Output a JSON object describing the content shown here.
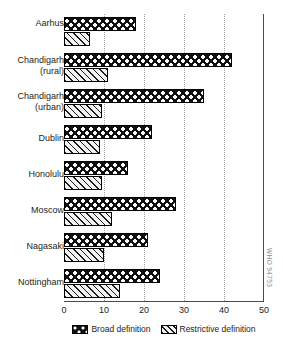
{
  "chart_data": {
    "type": "bar",
    "orientation": "horizontal",
    "title": "",
    "xlabel": "",
    "ylabel": "",
    "xlim": [
      0,
      50
    ],
    "xticks": [
      "0",
      "10",
      "20",
      "30",
      "40",
      "50"
    ],
    "grid": "vertical-dotted",
    "legend_position": "bottom-center",
    "categories": [
      "Aarhus",
      "Chandigarh (rural)",
      "Chandigarh (urban)",
      "Dublin",
      "Honolulu",
      "Moscow",
      "Nagasaki",
      "Nottingham"
    ],
    "category_lines": [
      [
        "Aarhus",
        ""
      ],
      [
        "Chandigarh",
        "(rural)"
      ],
      [
        "Chandigarh",
        "(urban)"
      ],
      [
        "Dublin",
        ""
      ],
      [
        "Honolulu",
        ""
      ],
      [
        "Moscow",
        ""
      ],
      [
        "Nagasaki",
        ""
      ],
      [
        "Nottingham",
        ""
      ]
    ],
    "series": [
      {
        "name": "Broad definition",
        "pattern": "wavy-black",
        "values": [
          18,
          42,
          35,
          22,
          16,
          28,
          21,
          24
        ]
      },
      {
        "name": "Restrictive definition",
        "pattern": "diagonal-hatch",
        "values": [
          6.5,
          11,
          9.5,
          9,
          9.5,
          12,
          10,
          14
        ]
      }
    ]
  },
  "legend": {
    "items": [
      {
        "label": "Broad definition"
      },
      {
        "label": "Restrictive definition"
      }
    ]
  },
  "watermark": {
    "text": "WHO 94753"
  }
}
